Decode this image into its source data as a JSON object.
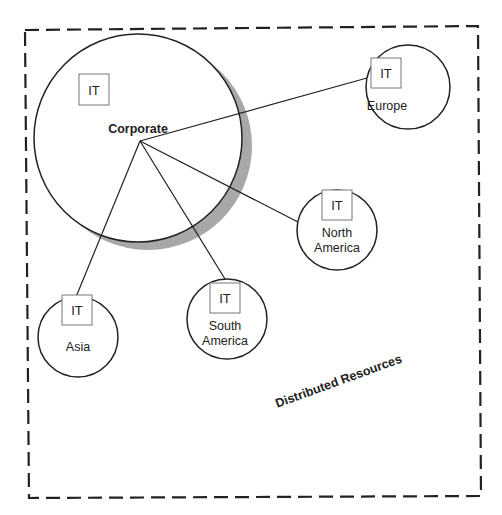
{
  "diagram": {
    "region_label": "Distributed Resources",
    "colors": {
      "stroke": "#222222",
      "shadow": "#a8a8a8",
      "box_stroke": "#777777",
      "background": "#ffffff"
    },
    "corporate": {
      "label": "Corporate",
      "it_label": "IT"
    },
    "sites": [
      {
        "id": "europe",
        "lines": [
          "Europe"
        ],
        "it_label": "IT"
      },
      {
        "id": "north-america",
        "lines": [
          "North",
          "America"
        ],
        "it_label": "IT"
      },
      {
        "id": "south-america",
        "lines": [
          "South",
          "America"
        ],
        "it_label": "IT"
      },
      {
        "id": "asia",
        "lines": [
          "Asia"
        ],
        "it_label": "IT"
      }
    ]
  }
}
